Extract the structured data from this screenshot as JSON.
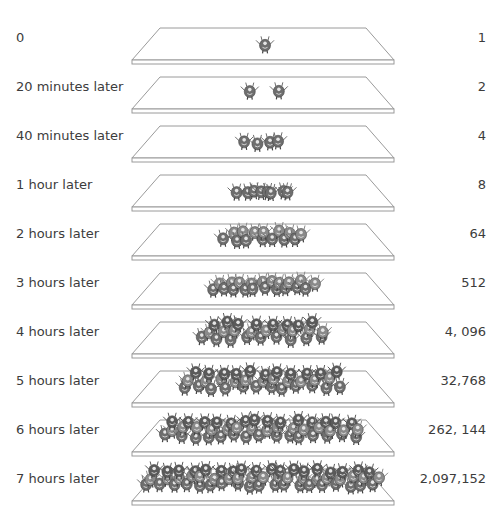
{
  "diagram": {
    "plate_color": "#9a9a9a",
    "bacteria_color": "#6e6e6e",
    "rows": [
      {
        "time": "0",
        "count": "1",
        "density": 1
      },
      {
        "time": "20 minutes later",
        "count": "2",
        "density": 2
      },
      {
        "time": "40 minutes later",
        "count": "4",
        "density": 4
      },
      {
        "time": "1 hour later",
        "count": "8",
        "density": 8
      },
      {
        "time": "2 hours later",
        "count": "64",
        "density": 14
      },
      {
        "time": "3 hours later",
        "count": "512",
        "density": 20
      },
      {
        "time": "4 hours later",
        "count": "4, 096",
        "density": 26
      },
      {
        "time": "5 hours later",
        "count": "32,768",
        "density": 34
      },
      {
        "time": "6 hours later",
        "count": "262, 144",
        "density": 44
      },
      {
        "time": "7 hours later",
        "count": "2,097,152",
        "density": 56
      }
    ]
  }
}
